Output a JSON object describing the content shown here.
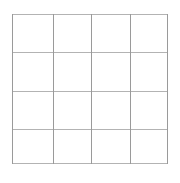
{
  "figure": {
    "name": "blank-grid",
    "background_color": "#ffffff",
    "rows": 4,
    "columns": 4,
    "cell_count": 16,
    "bounds": {
      "left": 12,
      "top": 14,
      "width": 156,
      "height": 150
    },
    "vertical_line_color": "#9a9a9a",
    "horizontal_line_color": "#b3b3b3",
    "line_width": 1,
    "vertical_lines": [
      {
        "label": "v0",
        "x": 0
      },
      {
        "label": "v1",
        "x": 41
      },
      {
        "label": "v2",
        "x": 79
      },
      {
        "label": "v3",
        "x": 118
      },
      {
        "label": "v4",
        "x": 155
      }
    ],
    "horizontal_lines": [
      {
        "label": "h0",
        "y": 0
      },
      {
        "label": "h1",
        "y": 38
      },
      {
        "label": "h2",
        "y": 77
      },
      {
        "label": "h3",
        "y": 115
      },
      {
        "label": "h4",
        "y": 149
      }
    ],
    "cells": [
      {
        "label": "r1c1",
        "row": 1,
        "col": 1,
        "text": ""
      },
      {
        "label": "r1c2",
        "row": 1,
        "col": 2,
        "text": ""
      },
      {
        "label": "r1c3",
        "row": 1,
        "col": 3,
        "text": ""
      },
      {
        "label": "r1c4",
        "row": 1,
        "col": 4,
        "text": ""
      },
      {
        "label": "r2c1",
        "row": 2,
        "col": 1,
        "text": ""
      },
      {
        "label": "r2c2",
        "row": 2,
        "col": 2,
        "text": ""
      },
      {
        "label": "r2c3",
        "row": 2,
        "col": 3,
        "text": ""
      },
      {
        "label": "r2c4",
        "row": 2,
        "col": 4,
        "text": ""
      },
      {
        "label": "r3c1",
        "row": 3,
        "col": 1,
        "text": ""
      },
      {
        "label": "r3c2",
        "row": 3,
        "col": 2,
        "text": ""
      },
      {
        "label": "r3c3",
        "row": 3,
        "col": 3,
        "text": ""
      },
      {
        "label": "r3c4",
        "row": 3,
        "col": 4,
        "text": ""
      },
      {
        "label": "r4c1",
        "row": 4,
        "col": 1,
        "text": ""
      },
      {
        "label": "r4c2",
        "row": 4,
        "col": 2,
        "text": ""
      },
      {
        "label": "r4c3",
        "row": 4,
        "col": 3,
        "text": ""
      },
      {
        "label": "r4c4",
        "row": 4,
        "col": 4,
        "text": ""
      }
    ]
  }
}
